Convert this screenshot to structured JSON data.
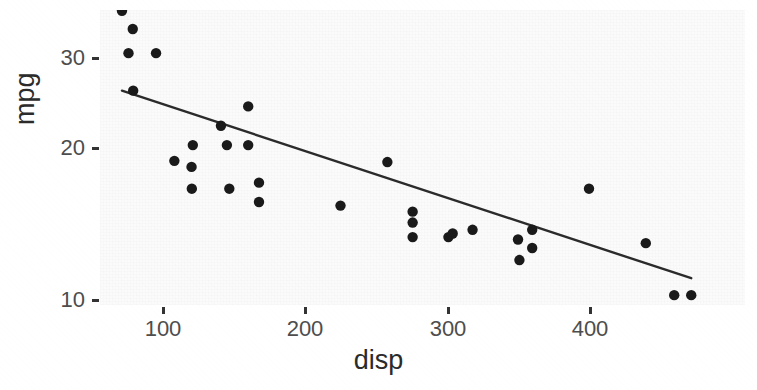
{
  "figure": {
    "kind": "scatter-with-regression-line",
    "background_color": "#fcfcfc",
    "point_color": "#1a1a1a",
    "line_color": "#2b2b2b"
  },
  "axes": {
    "x_title": "disp",
    "y_title": "mpg",
    "x_ticks": [
      "100",
      "200",
      "300",
      "400"
    ],
    "y_ticks": [
      "30",
      "20",
      "10"
    ]
  },
  "chart_data": {
    "type": "scatter",
    "title": "",
    "xlabel": "disp",
    "ylabel": "mpg",
    "xlim": [
      55,
      500
    ],
    "ylim": [
      9,
      34
    ],
    "xticks": [
      100,
      200,
      300,
      400
    ],
    "yticks": [
      10,
      20,
      30
    ],
    "grid": false,
    "legend": "none",
    "series": [
      {
        "name": "observations",
        "x": [
          71.1,
          75.7,
          78.7,
          79.0,
          95.1,
          108.0,
          120.1,
          120.3,
          121.0,
          140.8,
          145.0,
          146.7,
          160.0,
          160.0,
          167.6,
          167.6,
          225.0,
          258.0,
          275.8,
          275.8,
          275.8,
          301.0,
          304.0,
          318.0,
          350.0,
          351.0,
          360.0,
          360.0,
          400.0,
          440.0,
          460.0,
          472.0
        ],
        "y": [
          33.9,
          30.4,
          32.4,
          27.3,
          30.4,
          21.5,
          21.0,
          19.2,
          22.8,
          24.4,
          22.8,
          19.2,
          26.0,
          22.8,
          19.7,
          18.1,
          17.8,
          21.4,
          16.4,
          17.3,
          15.2,
          15.2,
          15.5,
          15.8,
          15.0,
          13.3,
          14.3,
          15.8,
          19.2,
          14.7,
          10.4,
          10.4
        ]
      }
    ],
    "fit_line": {
      "type": "linear-regression",
      "x_start": 71.1,
      "y_start": 27.3,
      "x_end": 472.0,
      "y_end": 11.8
    }
  }
}
